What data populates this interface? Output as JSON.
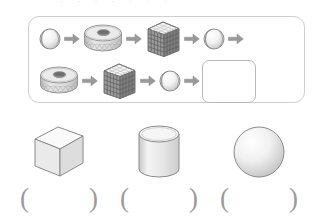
{
  "page": {
    "title_remnant": "· · ·  · · ·  ·",
    "background": "#ffffff",
    "border_color": "#cfcfcf",
    "shape_fill": "#ededed",
    "arrow_color": "#9a9a9a"
  },
  "pattern_panel": {
    "name": "shape-pattern-panel",
    "rows": [
      {
        "row_label": "pattern-row-1",
        "items": [
          {
            "kind": "shape",
            "shape": "sphere-ball",
            "label": "ball"
          },
          {
            "kind": "arrow",
            "shape": "arrow-right-icon",
            "label": "→"
          },
          {
            "kind": "shape",
            "shape": "ring-cylinder",
            "label": "cylinder"
          },
          {
            "kind": "arrow",
            "shape": "arrow-right-icon",
            "label": "→"
          },
          {
            "kind": "shape",
            "shape": "grid-cube",
            "label": "cube"
          },
          {
            "kind": "arrow",
            "shape": "arrow-right-icon",
            "label": "→"
          },
          {
            "kind": "shape",
            "shape": "sphere-ball",
            "label": "ball"
          },
          {
            "kind": "arrow",
            "shape": "arrow-right-icon",
            "label": "→"
          }
        ]
      },
      {
        "row_label": "pattern-row-2",
        "items": [
          {
            "kind": "shape",
            "shape": "ring-cylinder",
            "label": "cylinder"
          },
          {
            "kind": "arrow",
            "shape": "arrow-right-icon",
            "label": "→"
          },
          {
            "kind": "shape",
            "shape": "grid-cube",
            "label": "cube"
          },
          {
            "kind": "arrow",
            "shape": "arrow-right-icon",
            "label": "→"
          },
          {
            "kind": "shape",
            "shape": "sphere-ball",
            "label": "ball"
          },
          {
            "kind": "arrow",
            "shape": "arrow-right-icon",
            "label": "→"
          },
          {
            "kind": "answer",
            "shape": "empty-answer-box",
            "label": ""
          }
        ]
      }
    ]
  },
  "choices": [
    {
      "name": "choice-cube",
      "shape": "cube",
      "label": "cube",
      "answer": ""
    },
    {
      "name": "choice-cylinder",
      "shape": "cylinder",
      "label": "cylinder",
      "answer": ""
    },
    {
      "name": "choice-sphere",
      "shape": "sphere",
      "label": "sphere",
      "answer": ""
    }
  ],
  "parens": {
    "open": "(",
    "close": ")"
  }
}
